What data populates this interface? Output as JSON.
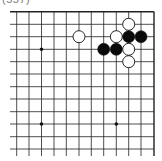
{
  "caption": "(557)",
  "board": {
    "grid": {
      "x_lines": [
        16.7,
        29,
        41.5,
        54,
        66.3,
        79,
        91.3,
        103.7,
        116.3,
        128.7,
        141,
        154
      ],
      "y_lines": [
        11.7,
        24.3,
        36.7,
        49.3,
        61.7,
        74,
        86.7,
        99,
        111.7,
        124,
        136.7,
        149
      ],
      "left_extent": 10,
      "bottom_extent": 156,
      "right_border_col": 11,
      "top_border_row": 0,
      "line_color": "#222222"
    },
    "star_points": [
      {
        "col": 2,
        "row": 3
      },
      {
        "col": 2,
        "row": 9
      },
      {
        "col": 8,
        "row": 9
      }
    ],
    "stones": [
      {
        "color": "white",
        "col": 9,
        "row": 1
      },
      {
        "color": "white",
        "col": 5,
        "row": 2
      },
      {
        "color": "white",
        "col": 8,
        "row": 2
      },
      {
        "color": "black",
        "col": 9,
        "row": 2
      },
      {
        "color": "black",
        "col": 10,
        "row": 2
      },
      {
        "color": "black",
        "col": 7,
        "row": 3
      },
      {
        "color": "black",
        "col": 8,
        "row": 3
      },
      {
        "color": "white",
        "col": 9,
        "row": 3
      },
      {
        "color": "white",
        "col": 9,
        "row": 4
      }
    ],
    "stone_radius": 6
  }
}
